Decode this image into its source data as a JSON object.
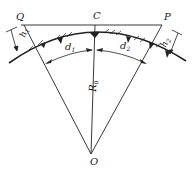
{
  "diagram": {
    "points": {
      "Q": "Q",
      "C": "C",
      "P": "P",
      "O": "O"
    },
    "dimensions": {
      "h1": "h",
      "h1_sub": "1",
      "h2": "h",
      "h2_sub": "2",
      "d1": "d",
      "d1_sub": "1",
      "d2": "d",
      "d2_sub": "2",
      "R0": "R",
      "R0_sub": "0"
    },
    "colors": {
      "line": "#222222",
      "background": "#ffffff"
    }
  }
}
